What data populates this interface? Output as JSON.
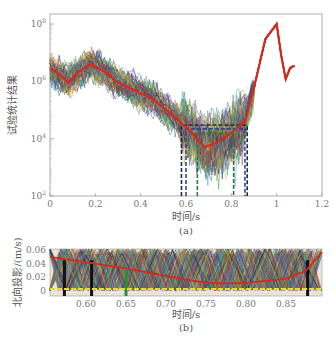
{
  "chart_data": [
    {
      "id": "a",
      "type": "line",
      "title": "",
      "caption": "(a)",
      "xlabel": "时间/s",
      "ylabel": "试验统计结果",
      "xlim": [
        0,
        1.2
      ],
      "ylim": [
        100,
        100000000
      ],
      "yscale": "log",
      "xticks": [
        "0",
        "0.2",
        "0.4",
        "0.6",
        "0.8",
        "1",
        "1.2"
      ],
      "yticks": [
        "10^2",
        "10^4",
        "10^6",
        "10^8"
      ],
      "grid": false,
      "legend": null,
      "series": [
        {
          "name": "mean (red)",
          "color": "#d42a1e",
          "x": [
            0,
            0.04,
            0.08,
            0.12,
            0.18,
            0.24,
            0.3,
            0.38,
            0.45,
            0.52,
            0.58,
            0.63,
            0.68,
            0.73,
            0.8,
            0.86,
            0.9,
            0.95,
            1.0,
            1.02,
            1.04,
            1.06,
            1.08
          ],
          "y": [
            3000000,
            1800000,
            900000,
            2000000,
            4000000,
            2200000,
            900000,
            450000,
            250000,
            90000,
            35000,
            15000,
            5000,
            7000,
            16000,
            40000,
            600000,
            30000000,
            100000000,
            8000000,
            1200000,
            3000000,
            3500000
          ]
        }
      ],
      "annotations": [
        {
          "type": "dashed-box",
          "x": [
            0.58,
            0.87
          ],
          "y_top": 30000,
          "color": "#1a2b4a"
        },
        {
          "type": "dashed-box",
          "x": [
            0.6,
            0.86
          ],
          "y_top": 22000,
          "color": "#2a4a8a"
        },
        {
          "type": "dashed-box",
          "x": [
            0.65,
            0.81
          ],
          "y_top": 15000,
          "color": "#2f7a3a"
        }
      ],
      "note": "Many overlapping colored Monte-Carlo trial curves with red mean; dashed boxes mark the minimum window ~0.58–0.87 s"
    },
    {
      "id": "b",
      "type": "line",
      "title": "",
      "caption": "(b)",
      "xlabel": "时间/s",
      "ylabel": "北向投影/(m/s)",
      "xlim": [
        0.555,
        0.895
      ],
      "ylim": [
        0,
        0.06
      ],
      "xticks": [
        "0.60",
        "0.65",
        "0.70",
        "0.75",
        "0.80",
        "0.85"
      ],
      "yticks": [
        "0",
        "0.02",
        "0.04",
        "0.06"
      ],
      "grid": false,
      "legend": null,
      "series": [
        {
          "name": "envelope (red)",
          "color": "#d42a1e",
          "x": [
            0.555,
            0.6,
            0.65,
            0.7,
            0.75,
            0.78,
            0.8,
            0.85,
            0.875,
            0.895
          ],
          "y": [
            0.05,
            0.042,
            0.033,
            0.022,
            0.012,
            0.011,
            0.012,
            0.018,
            0.03,
            0.057
          ]
        },
        {
          "name": "zero level (yellow)",
          "color": "#e8e020",
          "x": [
            0.555,
            0.895
          ],
          "y": [
            0.003,
            0.003
          ]
        }
      ],
      "note": "Dense zigzag colored trial lines fill the plot"
    }
  ]
}
